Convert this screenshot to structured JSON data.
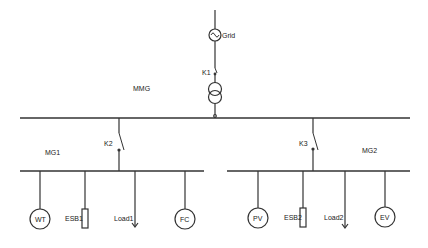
{
  "diagram": {
    "type": "single-line microgrid schematic",
    "colors": {
      "line": "#333333",
      "background": "#ffffff"
    },
    "source": {
      "label": "Grid",
      "icon": "ac-source-icon"
    },
    "main_switch": {
      "label": "K1"
    },
    "transformer": {
      "icon": "transformer-icon"
    },
    "main_bus": {
      "label": "MMG"
    },
    "microgrids": [
      {
        "label": "MG1",
        "switch_label": "K2",
        "components": [
          {
            "label": "WT",
            "kind": "generator"
          },
          {
            "label": "ESB1",
            "kind": "storage"
          },
          {
            "label": "Load1",
            "kind": "load"
          },
          {
            "label": "FC",
            "kind": "generator"
          }
        ]
      },
      {
        "label": "MG2",
        "switch_label": "K3",
        "components": [
          {
            "label": "PV",
            "kind": "generator"
          },
          {
            "label": "ESB2",
            "kind": "storage"
          },
          {
            "label": "Load2",
            "kind": "load"
          },
          {
            "label": "EV",
            "kind": "generator"
          }
        ]
      }
    ]
  }
}
